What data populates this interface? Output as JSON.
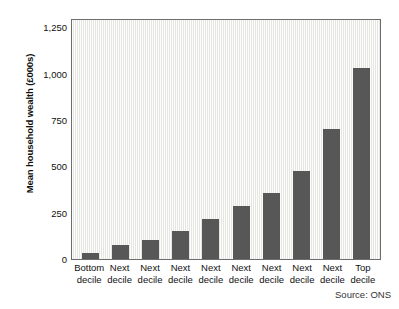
{
  "chart_data": {
    "type": "bar",
    "title": "",
    "xlabel": "",
    "ylabel": "Mean household wealth (£000s)",
    "categories": [
      "Bottom decile",
      "Next decile",
      "Next decile",
      "Next decile",
      "Next decile",
      "Next decile",
      "Next decile",
      "Next decile",
      "Next decile",
      "Top decile"
    ],
    "category_lines": [
      [
        "Bottom",
        "decile"
      ],
      [
        "Next",
        "decile"
      ],
      [
        "Next",
        "decile"
      ],
      [
        "Next",
        "decile"
      ],
      [
        "Next",
        "decile"
      ],
      [
        "Next",
        "decile"
      ],
      [
        "Next",
        "decile"
      ],
      [
        "Next",
        "decile"
      ],
      [
        "Next",
        "decile"
      ],
      [
        "Top",
        "decile"
      ]
    ],
    "values": [
      30,
      75,
      100,
      150,
      215,
      285,
      355,
      475,
      700,
      1030
    ],
    "ylim": [
      0,
      1300
    ],
    "yticks": [
      0,
      250,
      500,
      750,
      1000,
      1250
    ],
    "ytick_labels": [
      "0",
      "250",
      "500",
      "750",
      "1,000",
      "1,250"
    ],
    "grid": false,
    "legend": "none",
    "bar_color": "#575757",
    "plot_background": "#f0f0ee",
    "axis_color": "#6d6d6d",
    "source": "Source: ONS"
  }
}
